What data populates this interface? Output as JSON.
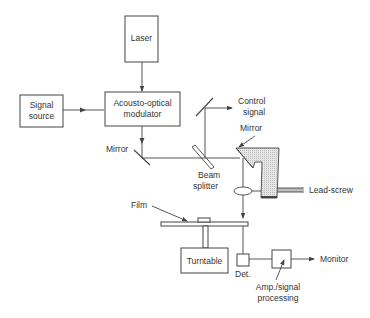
{
  "diagram": {
    "type": "optical-system-schematic",
    "colors": {
      "line": "#444444",
      "text": "#333333",
      "background": "#ffffff",
      "carriage_fill": "#d9d9d9"
    },
    "nodes": {
      "laser": {
        "label": "Laser"
      },
      "signal_source": {
        "line1": "Signal",
        "line2": "source"
      },
      "aom": {
        "line1": "Acousto-optical",
        "line2": "modulator"
      },
      "mirror_left": {
        "label": "Mirror"
      },
      "control_signal": {
        "line1": "Control",
        "line2": "signal"
      },
      "mirror_right": {
        "label": "Mirror"
      },
      "beam_splitter": {
        "line1": "Beam",
        "line2": "splitter"
      },
      "lead_screw": {
        "label": "Lead-screw"
      },
      "film": {
        "label": "Film"
      },
      "turntable": {
        "label": "Turntable"
      },
      "detector": {
        "label": "Det."
      },
      "amp": {
        "line1": "Amp./signal",
        "line2": "processing"
      },
      "monitor": {
        "label": "Monitor"
      }
    },
    "edges": [
      {
        "from": "laser",
        "to": "aom"
      },
      {
        "from": "signal_source",
        "to": "aom"
      },
      {
        "from": "aom",
        "to": "mirror_left"
      },
      {
        "from": "mirror_left",
        "to": "beam_splitter"
      },
      {
        "from": "beam_splitter",
        "to": "control_signal"
      },
      {
        "from": "beam_splitter",
        "to": "mirror_right"
      },
      {
        "from": "mirror_right",
        "to": "film"
      },
      {
        "from": "film",
        "to": "detector"
      },
      {
        "from": "detector",
        "to": "amp"
      },
      {
        "from": "amp",
        "to": "monitor"
      }
    ]
  }
}
